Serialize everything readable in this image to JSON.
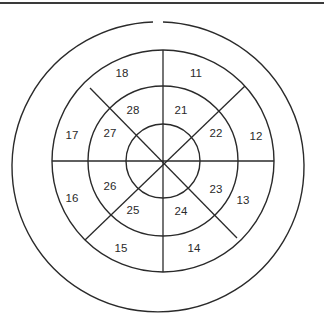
{
  "diagram": {
    "title": "",
    "type": "concentric-ring-segment-map",
    "rings": [
      {
        "name": "inner-core",
        "labels": []
      },
      {
        "name": "middle-ring",
        "labels": [
          "21",
          "22",
          "23",
          "24",
          "25",
          "26",
          "27",
          "28"
        ]
      },
      {
        "name": "outer-ring",
        "labels": [
          "11",
          "12",
          "13",
          "14",
          "15",
          "16",
          "17",
          "18"
        ]
      }
    ],
    "segments_per_ring": 8,
    "outer_boundary": {
      "has_gap_at_top": true
    },
    "colors": {
      "line": "#2a2a2a",
      "background": "#ffffff",
      "text": "#2a2a2a"
    }
  }
}
